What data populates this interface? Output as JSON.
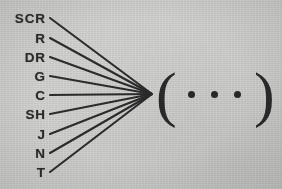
{
  "figure": {
    "background_color": "#d4d4d2",
    "ink_color": "#2b2b2b"
  },
  "labels": [
    {
      "text": "SCR",
      "y": 18
    },
    {
      "text": "R",
      "y": 38
    },
    {
      "text": "DR",
      "y": 57
    },
    {
      "text": "G",
      "y": 76
    },
    {
      "text": "C",
      "y": 95
    },
    {
      "text": "SH",
      "y": 114
    },
    {
      "text": "J",
      "y": 134
    },
    {
      "text": "N",
      "y": 153
    },
    {
      "text": "T",
      "y": 172
    }
  ],
  "fan": {
    "start_x": 50,
    "converge_x": 152,
    "converge_y": 94,
    "line_count": 9,
    "stroke_color": "#2d2d2d"
  },
  "group": {
    "open_paren": "(",
    "close_paren": ")",
    "ellipsis_dot_count": 3,
    "dot_x_positions": [
      188,
      211,
      234
    ],
    "dot_color": "#2b2b2b"
  }
}
